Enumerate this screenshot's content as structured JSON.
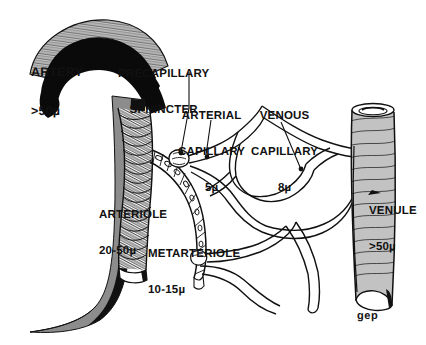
{
  "figure": {
    "background_color": "#ffffff",
    "ink_color": "#111111",
    "shade_color": "#8c8c8c"
  },
  "labels": {
    "artery": {
      "line1": "ARTERY",
      "line2": ">50µ"
    },
    "precapillary_sphincter": {
      "line1": "PRECAPILLARY",
      "line2": "SPHINCTER"
    },
    "arterial_capillary": {
      "line1": "ARTERIAL",
      "line2": "CAPILLARY",
      "line3": "5µ"
    },
    "venous_capillary": {
      "line1": "VENOUS",
      "line2": "CAPILLARY",
      "line3": "8µ"
    },
    "arteriole": {
      "line1": "ARTERIOLE",
      "line2": "20-50µ"
    },
    "metarteriole": {
      "line1": "METARTERIOLE",
      "line2": "10-15µ"
    },
    "venule": {
      "line1": "VENULE",
      "line2": ">50µ"
    },
    "signature": "gep"
  },
  "structures": [
    {
      "name": "artery",
      "caliber": ">50µ",
      "description": "large curved vessel at upper left, dark lumen with hatched wall"
    },
    {
      "name": "arteriole",
      "caliber": "20-50µ",
      "description": "coiled smooth-muscle tube descending from artery"
    },
    {
      "name": "precapillary-sphincter",
      "caliber": "",
      "description": "ringed constriction at capillary origin"
    },
    {
      "name": "metarteriole",
      "caliber": "10-15µ",
      "description": "segmented channel with sparse muscle cells"
    },
    {
      "name": "arterial-capillary",
      "caliber": "5µ",
      "description": "thin-walled capillary arising at sphincter"
    },
    {
      "name": "venous-capillary",
      "caliber": "8µ",
      "description": "wider capillary draining to venule"
    },
    {
      "name": "venule",
      "caliber": ">50µ",
      "description": "fiber-wrapped collecting vessel at right"
    }
  ]
}
